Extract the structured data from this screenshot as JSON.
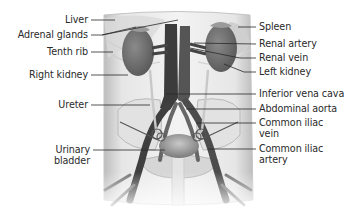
{
  "diagram": {
    "type": "anatomical-illustration",
    "left_labels": [
      {
        "id": "liver",
        "text": "Liver",
        "x": 0,
        "y": 14,
        "w": 88
      },
      {
        "id": "adrenal-glands",
        "text": "Adrenal glands",
        "x": 0,
        "y": 29,
        "w": 88
      },
      {
        "id": "tenth-rib",
        "text": "Tenth rib",
        "x": 0,
        "y": 46,
        "w": 88
      },
      {
        "id": "right-kidney",
        "text": "Right kidney",
        "x": 0,
        "y": 69,
        "w": 88
      },
      {
        "id": "ureter",
        "text": "Ureter",
        "x": 0,
        "y": 99,
        "w": 88
      },
      {
        "id": "urinary-bladder",
        "text": "Urinary bladder",
        "x": 46,
        "y": 145,
        "w": 44
      }
    ],
    "right_labels": [
      {
        "id": "spleen",
        "text": "Spleen",
        "x": 259,
        "y": 21
      },
      {
        "id": "renal-artery",
        "text": "Renal artery",
        "x": 259,
        "y": 38
      },
      {
        "id": "renal-vein",
        "text": "Renal vein",
        "x": 259,
        "y": 52
      },
      {
        "id": "left-kidney",
        "text": "Left kidney",
        "x": 259,
        "y": 66
      },
      {
        "id": "inferior-vena-cava",
        "text": "Inferior vena cava",
        "x": 259,
        "y": 88
      },
      {
        "id": "abdominal-aorta",
        "text": "Abdominal aorta",
        "x": 259,
        "y": 103
      },
      {
        "id": "common-iliac-vein",
        "text": "Common iliac vein",
        "x": 259,
        "y": 117,
        "w": 70
      },
      {
        "id": "common-iliac-artery",
        "text": "Common iliac artery",
        "x": 259,
        "y": 143,
        "w": 70
      }
    ],
    "colors": {
      "background": "#ffffff",
      "body_outline": "#c8c8c8",
      "organ": "#6e6e6e",
      "vessel": "#3f3f3f",
      "leader_line": "#2a2a2a",
      "label_text": "#2a2a2a"
    }
  }
}
